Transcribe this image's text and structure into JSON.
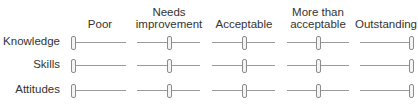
{
  "columns": [
    {
      "line1": "",
      "line2": "Poor"
    },
    {
      "line1": "Needs",
      "line2": "improvement"
    },
    {
      "line1": "",
      "line2": "Acceptable"
    },
    {
      "line1": "More than",
      "line2": "acceptable"
    },
    {
      "line1": "",
      "line2": "Outstanding"
    }
  ],
  "rows": [
    {
      "label": "Knowledge",
      "values": [
        0,
        50,
        50,
        50,
        100
      ]
    },
    {
      "label": "Skills",
      "values": [
        0,
        50,
        50,
        50,
        100
      ]
    },
    {
      "label": "Attitudes",
      "values": [
        0,
        50,
        50,
        50,
        100
      ]
    }
  ],
  "colors": {
    "track": "#9a9a9a",
    "thumb_border": "#8c8c8c",
    "thumb_fill": "#f4f4f4",
    "text": "#333333"
  }
}
